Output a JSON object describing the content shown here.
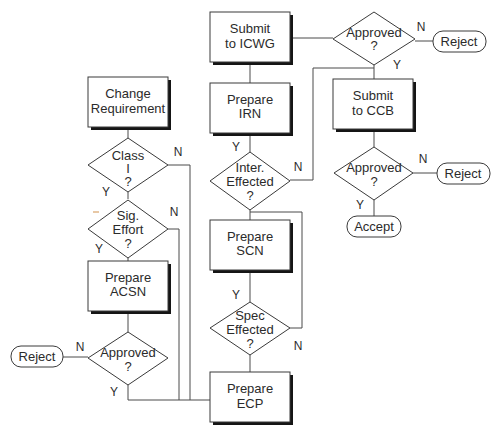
{
  "diagram": {
    "type": "flowchart",
    "nodes": {
      "submit_icwg": {
        "lines": [
          "Submit",
          "to ICWG"
        ]
      },
      "approved_icwg": {
        "lines": [
          "Approved",
          "?"
        ]
      },
      "reject_icwg": {
        "label": "Reject"
      },
      "submit_ccb": {
        "lines": [
          "Submit",
          "to CCB"
        ]
      },
      "prepare_irn": {
        "lines": [
          "Prepare",
          "IRN"
        ]
      },
      "inter_effected": {
        "lines": [
          "Inter.",
          "Effected",
          "?"
        ]
      },
      "approved_ccb": {
        "lines": [
          "Approved",
          "?"
        ]
      },
      "reject_ccb": {
        "label": "Reject"
      },
      "accept": {
        "label": "Accept"
      },
      "change_requirement": {
        "lines": [
          "Change",
          "Requirement"
        ]
      },
      "class_i": {
        "lines": [
          "Class",
          "I",
          "?"
        ]
      },
      "sig_effort": {
        "lines": [
          "Sig.",
          "Effort",
          "?"
        ]
      },
      "prepare_acsn": {
        "lines": [
          "Prepare",
          "ACSN"
        ]
      },
      "approved_acsn": {
        "lines": [
          "Approved",
          "?"
        ]
      },
      "reject_acsn": {
        "label": "Reject"
      },
      "prepare_scn": {
        "lines": [
          "Prepare",
          "SCN"
        ]
      },
      "spec_effected": {
        "lines": [
          "Spec",
          "Effected",
          "?"
        ]
      },
      "prepare_ecp": {
        "lines": [
          "Prepare",
          "ECP"
        ]
      }
    },
    "edge_labels": {
      "yes": "Y",
      "no": "N"
    },
    "colors": {
      "stroke": "#3a3a3a",
      "shadow": "#151515",
      "text": "#2b2b2b",
      "background": "#ffffff"
    }
  }
}
